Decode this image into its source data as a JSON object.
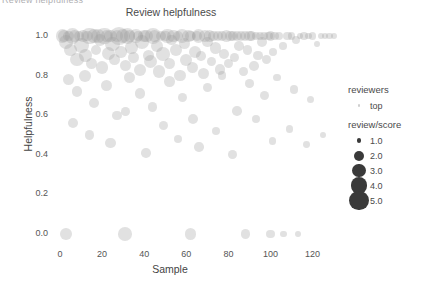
{
  "window": {
    "clipped_top_text": "Review helpfulness"
  },
  "chart_data": {
    "type": "scatter",
    "title": "Review helpfulness",
    "xlabel": "Sample",
    "ylabel": "Helpfulness",
    "xlim": [
      -6,
      133
    ],
    "ylim": [
      -0.06,
      1.06
    ],
    "xticks": [
      0,
      20,
      40,
      60,
      80,
      100,
      120
    ],
    "xticklabels": [
      "0",
      "20",
      "40",
      "60",
      "80",
      "100",
      "120"
    ],
    "yticks": [
      0.0,
      0.2,
      0.4,
      0.6,
      0.8,
      1.0
    ],
    "yticklabels": [
      "0.0",
      "0.2",
      "0.4",
      "0.6",
      "0.8",
      "1.0"
    ],
    "grid": false,
    "legend_position": "right",
    "point_color": "#9a9a9a",
    "point_opacity": 0.3,
    "size_encoding": "review/score",
    "series": [
      {
        "name": "top",
        "x": [
          1,
          2,
          3,
          4,
          5,
          6,
          7,
          8,
          9,
          10,
          11,
          12,
          13,
          14,
          15,
          16,
          17,
          18,
          19,
          20,
          21,
          22,
          23,
          24,
          25,
          26,
          27,
          28,
          29,
          30,
          31,
          32,
          33,
          34,
          35,
          36,
          37,
          38,
          39,
          40,
          41,
          42,
          43,
          44,
          45,
          46,
          47,
          48,
          49,
          50,
          51,
          52,
          53,
          54,
          55,
          56,
          57,
          58,
          59,
          60,
          61,
          62,
          63,
          64,
          65,
          66,
          67,
          68,
          69,
          70,
          71,
          72,
          73,
          74,
          75,
          76,
          77,
          78,
          79,
          80,
          81,
          82,
          83,
          84,
          85,
          86,
          87,
          88,
          89,
          90,
          91,
          92,
          93,
          94,
          95,
          96,
          97,
          98,
          99,
          100,
          101,
          102,
          104,
          106,
          108,
          110,
          112,
          114,
          116,
          118,
          120,
          122,
          124,
          126,
          128,
          130,
          4,
          8,
          12,
          16,
          22,
          27,
          33,
          38,
          44,
          52,
          58,
          63,
          70,
          77,
          84,
          90,
          97,
          103,
          111,
          119,
          6,
          14,
          24,
          31,
          41,
          49,
          56,
          66,
          74,
          82,
          93,
          101,
          109,
          117,
          125,
          3,
          31,
          62,
          88,
          100,
          106,
          113
        ],
        "y": [
          1.0,
          1.0,
          0.97,
          1.0,
          0.93,
          1.0,
          1.0,
          0.88,
          1.0,
          0.95,
          1.0,
          0.9,
          1.0,
          1.0,
          0.86,
          1.0,
          0.93,
          1.0,
          0.98,
          0.84,
          1.0,
          1.0,
          0.91,
          1.0,
          0.96,
          0.88,
          1.0,
          1.0,
          0.92,
          1.0,
          0.85,
          1.0,
          1.0,
          0.94,
          0.89,
          1.0,
          1.0,
          0.83,
          0.97,
          1.0,
          1.0,
          0.9,
          0.87,
          1.0,
          1.0,
          0.95,
          0.82,
          1.0,
          0.91,
          1.0,
          1.0,
          0.86,
          0.98,
          1.0,
          0.93,
          1.0,
          0.8,
          1.0,
          0.96,
          0.88,
          1.0,
          1.0,
          0.84,
          0.92,
          1.0,
          1.0,
          0.9,
          0.81,
          1.0,
          0.97,
          1.0,
          0.87,
          1.0,
          0.94,
          1.0,
          0.83,
          1.0,
          0.91,
          1.0,
          0.86,
          1.0,
          1.0,
          0.89,
          1.0,
          0.95,
          1.0,
          0.82,
          1.0,
          0.93,
          1.0,
          1.0,
          0.85,
          1.0,
          0.9,
          1.0,
          0.97,
          1.0,
          0.88,
          1.0,
          1.0,
          0.92,
          1.0,
          1.0,
          0.95,
          1.0,
          1.0,
          0.98,
          1.0,
          1.0,
          1.0,
          1.0,
          0.96,
          1.0,
          1.0,
          1.0,
          1.0,
          0.78,
          0.72,
          0.8,
          0.66,
          0.75,
          0.6,
          0.79,
          0.71,
          0.64,
          0.77,
          0.69,
          0.58,
          0.74,
          0.8,
          0.62,
          0.76,
          0.7,
          0.79,
          0.73,
          0.68,
          0.56,
          0.5,
          0.46,
          0.62,
          0.41,
          0.55,
          0.48,
          0.44,
          0.52,
          0.4,
          0.58,
          0.47,
          0.53,
          0.45,
          0.5,
          0.0,
          0.0,
          0.0,
          0.0,
          0.0,
          0.0,
          0.0
        ],
        "size": [
          3.2,
          2.8,
          3.5,
          2.4,
          3.0,
          4.0,
          2.6,
          3.3,
          2.2,
          3.8,
          2.9,
          3.1,
          2.5,
          4.2,
          2.7,
          3.4,
          2.3,
          3.6,
          2.8,
          3.0,
          4.4,
          2.6,
          3.2,
          2.9,
          3.7,
          2.4,
          3.0,
          4.6,
          2.7,
          3.3,
          2.5,
          3.9,
          2.8,
          3.1,
          2.6,
          3.4,
          2.2,
          2.9,
          3.5,
          2.7,
          3.0,
          2.4,
          3.2,
          4.1,
          2.6,
          2.8,
          3.0,
          2.3,
          3.3,
          2.5,
          3.6,
          2.7,
          2.4,
          3.1,
          2.9,
          2.2,
          2.6,
          3.4,
          2.5,
          2.8,
          3.0,
          2.3,
          2.6,
          2.9,
          2.4,
          3.2,
          2.1,
          2.5,
          2.7,
          2.3,
          2.8,
          2.0,
          2.4,
          2.6,
          2.2,
          2.5,
          2.1,
          2.3,
          2.6,
          2.0,
          2.4,
          2.2,
          1.9,
          2.3,
          2.1,
          2.5,
          1.8,
          2.2,
          2.0,
          2.3,
          1.9,
          2.1,
          1.7,
          2.0,
          1.8,
          2.2,
          1.6,
          1.9,
          1.7,
          2.0,
          1.5,
          1.8,
          1.6,
          1.4,
          1.7,
          1.3,
          1.5,
          1.2,
          1.4,
          1.1,
          1.3,
          1.0,
          1.2,
          1.0,
          1.1,
          1.0,
          2.6,
          2.4,
          2.8,
          2.2,
          2.5,
          2.0,
          2.7,
          2.3,
          2.1,
          2.4,
          1.9,
          2.2,
          2.0,
          1.8,
          2.1,
          1.7,
          1.9,
          1.5,
          1.6,
          1.3,
          2.2,
          2.0,
          2.4,
          1.8,
          2.1,
          1.9,
          1.7,
          2.0,
          1.6,
          1.8,
          1.5,
          1.4,
          1.3,
          1.2,
          1.1,
          2.8,
          3.4,
          2.6,
          2.0,
          1.6,
          1.2,
          1.0
        ]
      }
    ],
    "legend": {
      "groups": [
        {
          "title": "reviewers",
          "entries": [
            {
              "label": "top",
              "size": 1.2,
              "faint": true
            }
          ]
        },
        {
          "title": "review/score",
          "entries": [
            {
              "label": "1.0",
              "size": 2.4,
              "faint": false
            },
            {
              "label": "2.0",
              "size": 5.0,
              "faint": false
            },
            {
              "label": "3.0",
              "size": 6.6,
              "faint": false
            },
            {
              "label": "4.0",
              "size": 8.2,
              "faint": false
            },
            {
              "label": "5.0",
              "size": 9.6,
              "faint": false
            }
          ]
        }
      ]
    }
  }
}
